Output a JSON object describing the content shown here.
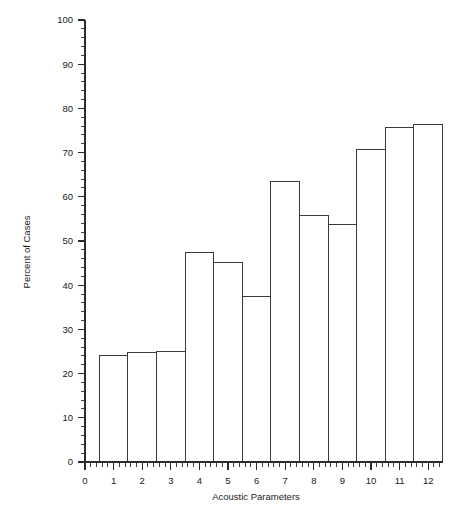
{
  "chart_data": {
    "type": "bar",
    "title": "",
    "subtitle": "",
    "xlabel": "Acoustic Parameters",
    "ylabel": "Percent of Cases",
    "categories": [
      "1",
      "2",
      "3",
      "4",
      "5",
      "6",
      "7",
      "8",
      "9",
      "10",
      "11",
      "12"
    ],
    "values": [
      24.0,
      24.7,
      25.0,
      47.4,
      45.2,
      37.4,
      63.5,
      55.7,
      53.7,
      70.8,
      75.6,
      76.4
    ],
    "series": [
      {
        "name": "Percent of Cases",
        "values": [
          24.0,
          24.7,
          25.0,
          47.4,
          45.2,
          37.4,
          63.5,
          55.7,
          53.7,
          70.8,
          75.6,
          76.4
        ]
      }
    ],
    "x": [
      1,
      2,
      3,
      4,
      5,
      6,
      7,
      8,
      9,
      10,
      11,
      12
    ],
    "xlim": [
      0,
      12.5
    ],
    "ylim": [
      0,
      100
    ],
    "x_tick_labels": [
      "0",
      "1",
      "2",
      "3",
      "4",
      "5",
      "6",
      "7",
      "8",
      "9",
      "10",
      "11",
      "12"
    ],
    "x_tick_values": [
      0,
      1,
      2,
      3,
      4,
      5,
      6,
      7,
      8,
      9,
      10,
      11,
      12
    ],
    "x_minor_tick_step": 0.2,
    "y_tick_labels": [
      "0",
      "10",
      "20",
      "30",
      "40",
      "50",
      "60",
      "70",
      "80",
      "90",
      "100"
    ],
    "y_tick_values": [
      0,
      10,
      20,
      30,
      40,
      50,
      60,
      70,
      80,
      90,
      100
    ],
    "y_minor_tick_step": 2,
    "grid": false,
    "legend": null,
    "legend_position": "none",
    "bar_width_units": 1.0,
    "bar_offset_units": -0.5,
    "bar_fill": "none",
    "bar_stroke": "#3a3a3a",
    "axis_color": "#2b2b2b",
    "background": "#ffffff",
    "annotations": []
  },
  "axes": {
    "y_title": "Percent of Cases",
    "x_title": "Acoustic Parameters"
  }
}
